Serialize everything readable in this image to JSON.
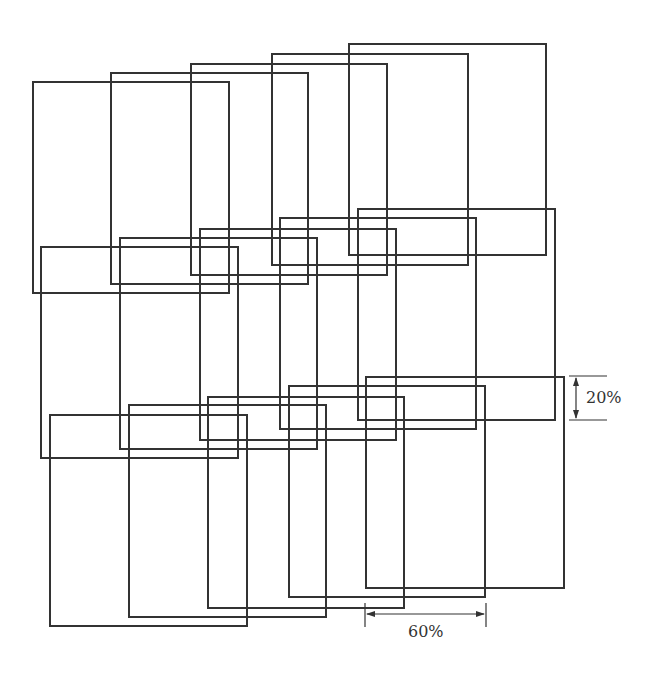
{
  "diagram": {
    "stroke_color": "#333333",
    "background": "#ffffff",
    "rows": [
      {
        "rects": [
          {
            "x": 32,
            "y": 81,
            "w": 198,
            "h": 213
          },
          {
            "x": 110,
            "y": 72,
            "w": 199,
            "h": 213
          },
          {
            "x": 190,
            "y": 63,
            "w": 198,
            "h": 213
          },
          {
            "x": 271,
            "y": 53,
            "w": 198,
            "h": 213
          },
          {
            "x": 348,
            "y": 43,
            "w": 199,
            "h": 213
          }
        ]
      },
      {
        "rects": [
          {
            "x": 40,
            "y": 246,
            "w": 199,
            "h": 213
          },
          {
            "x": 119,
            "y": 237,
            "w": 199,
            "h": 213
          },
          {
            "x": 199,
            "y": 228,
            "w": 198,
            "h": 213
          },
          {
            "x": 279,
            "y": 217,
            "w": 198,
            "h": 213
          },
          {
            "x": 357,
            "y": 208,
            "w": 199,
            "h": 213
          }
        ]
      },
      {
        "rects": [
          {
            "x": 49,
            "y": 414,
            "w": 199,
            "h": 213
          },
          {
            "x": 128,
            "y": 404,
            "w": 199,
            "h": 214
          },
          {
            "x": 207,
            "y": 396,
            "w": 198,
            "h": 213
          },
          {
            "x": 288,
            "y": 385,
            "w": 198,
            "h": 213
          },
          {
            "x": 365,
            "y": 376,
            "w": 200,
            "h": 213
          }
        ]
      }
    ],
    "annotations": {
      "vertical_overlap": {
        "label": "20%",
        "x": 576,
        "y1": 376,
        "y2": 420
      },
      "horizontal_overlap": {
        "label": "60%",
        "y": 614,
        "x1": 365,
        "x2": 486
      }
    }
  }
}
